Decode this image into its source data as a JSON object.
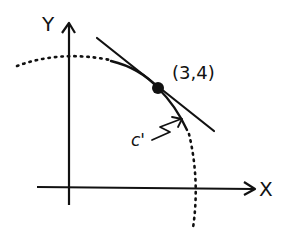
{
  "diagram": {
    "type": "tangent line to a circle at a point",
    "axes": {
      "x_label": "X",
      "y_label": "Y"
    },
    "point": {
      "label": "(3,4)",
      "x": 3,
      "y": 4
    },
    "curve": {
      "label": "c'",
      "style_near_point": "solid",
      "style_elsewhere": "dotted"
    },
    "tangent_line": {
      "style": "solid"
    },
    "colors": {
      "ink": "#111111",
      "background": "#ffffff"
    }
  }
}
